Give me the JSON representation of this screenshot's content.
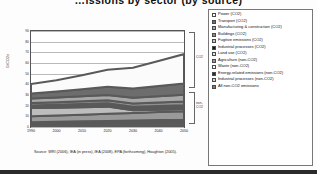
{
  "title": "…issions by sector (by source)",
  "chart_data": {
    "type": "area",
    "xlabel": "",
    "ylabel": "GtCO2e",
    "xlim": [
      1990,
      2050
    ],
    "ylim": [
      0,
      90
    ],
    "grid": true,
    "legend_position": "right",
    "x": [
      1990,
      2000,
      2010,
      2020,
      2030,
      2040,
      2050
    ],
    "xticklabels": [
      "1990",
      "2000",
      "2010",
      "2020",
      "2030",
      "2040",
      "2050"
    ],
    "yticklabels": [
      "0",
      "10",
      "20",
      "30",
      "40",
      "50",
      "60",
      "70",
      "80",
      "90"
    ],
    "series": [
      {
        "name": "Power (CO2)",
        "color": "#fbfbfb",
        "values": [
          9.0,
          10.6,
          13.2,
          16.0,
          19.6,
          23.5,
          27.5
        ]
      },
      {
        "name": "Transport (CO2)",
        "color": "#6d6d6d",
        "values": [
          4.6,
          5.6,
          6.6,
          7.6,
          8.6,
          9.6,
          10.6
        ]
      },
      {
        "name": "Manufacturing & construction (CO2)",
        "color": "#a8a8a8",
        "values": [
          4.1,
          4.3,
          4.6,
          5.0,
          5.4,
          5.8,
          6.2
        ]
      },
      {
        "name": "Buildings (CO2)",
        "color": "#8f8f8f",
        "values": [
          2.4,
          2.5,
          2.7,
          2.9,
          3.1,
          3.3,
          3.5
        ]
      },
      {
        "name": "Fugitive emissions (CO2)",
        "color": "#c8c8c8",
        "values": [
          1.3,
          1.4,
          1.5,
          1.6,
          1.7,
          1.8,
          1.9
        ]
      },
      {
        "name": "Industrial processes (CO2)",
        "color": "#151515",
        "values": [
          1.2,
          1.3,
          1.4,
          1.5,
          1.6,
          1.7,
          1.8
        ]
      },
      {
        "name": "Land use (CO2)",
        "color": "#bdbdbd",
        "values": [
          7.6,
          7.3,
          7.0,
          6.7,
          2.4,
          2.2,
          2.0
        ]
      },
      {
        "name": "Agriculture (non-CO2)",
        "color": "#9a9a9a",
        "values": [
          5.6,
          5.9,
          6.3,
          6.7,
          7.1,
          7.5,
          7.9
        ]
      },
      {
        "name": "Waste (non-CO2)",
        "color": "#f0f0f0",
        "values": [
          1.4,
          1.5,
          1.6,
          1.7,
          1.8,
          1.9,
          2.0
        ]
      },
      {
        "name": "Energy-related emissions (non-CO2)",
        "color": "#5a5a5a",
        "values": [
          2.6,
          2.8,
          3.0,
          3.2,
          3.4,
          3.6,
          3.8
        ]
      },
      {
        "name": "Industrial processes (non-CO2)",
        "color": "#d6d6d6",
        "values": [
          0.5,
          0.6,
          0.7,
          0.8,
          0.9,
          1.0,
          1.1
        ]
      }
    ],
    "annotations": [
      {
        "label": "CO2",
        "type": "bracket",
        "position": "right-upper"
      },
      {
        "label": "non-CO2",
        "type": "bracket",
        "position": "right-lower"
      }
    ]
  },
  "axes": {
    "ylabel": "GtCO2e",
    "yticks": [
      "90",
      "80",
      "70",
      "60",
      "50",
      "40",
      "30",
      "20",
      "10",
      "0"
    ],
    "xticks": [
      "1990",
      "2000",
      "2010",
      "2020",
      "2030",
      "2040",
      "2050"
    ]
  },
  "brackets": {
    "co2": "CO2",
    "non_co2_line1": "non-",
    "non_co2_line2": "CO2"
  },
  "source": {
    "line1": "Source: WRI (2006), IEA (in press), IEA (2008), EPA",
    "line2": "(forthcoming), Houghton (2005)."
  },
  "legend": {
    "items": [
      {
        "label": "Power (CO2)",
        "swatch": "#ffffff"
      },
      {
        "label": "Transport (CO2)",
        "swatch": "#6d6d6d"
      },
      {
        "label": "Manufacturing & construction (CO2)",
        "swatch": "#a8a8a8"
      },
      {
        "label": "Buildings (CO2)",
        "swatch": "#8f8f8f"
      },
      {
        "label": "Fugitive emissions (CO2)",
        "swatch": "#c8c8c8"
      },
      {
        "label": "Industrial processes (CO2)",
        "swatch": "#151515"
      },
      {
        "label": "Land use (CO2)",
        "swatch": "#e4e4e4"
      },
      {
        "label": "Agriculture (non-CO2)",
        "swatch": "#9a9a9a"
      },
      {
        "label": "Waste (non-CO2)",
        "swatch": "#fafafa"
      },
      {
        "label": "Energy-related emissions (non-CO2)",
        "swatch": "#2e2e2e"
      },
      {
        "label": "Industrial processes (non-CO2)",
        "swatch": "#d6d6d6"
      },
      {
        "label": "All non-CO2 emissions",
        "swatch": "#7d7d7d"
      }
    ]
  }
}
